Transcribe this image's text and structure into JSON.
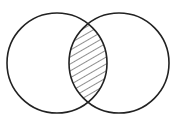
{
  "diagram": {
    "type": "venn",
    "sets": [
      {
        "id": "A",
        "cx": 57,
        "cy": 63,
        "r": 50
      },
      {
        "id": "B",
        "cx": 119,
        "cy": 63,
        "r": 50
      }
    ],
    "shaded_region": "A-intersection-B",
    "shading": "diagonal-hatch",
    "colors": {
      "stroke": "#222222",
      "hatch": "#333333",
      "background": "#ffffff"
    }
  }
}
